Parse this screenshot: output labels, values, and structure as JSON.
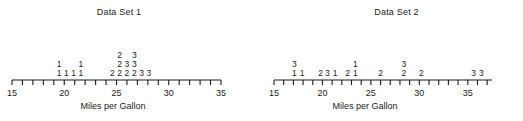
{
  "chart_data": [
    {
      "type": "scatter",
      "plot_style": "stacked-dot-plot",
      "title": "Data Set 1",
      "xlabel": "Miles per Gallon",
      "ylabel": "",
      "xlim": [
        15,
        35
      ],
      "tick_step": 1,
      "tick_labels": [
        "15",
        "20",
        "25",
        "30",
        "35"
      ],
      "tick_label_values": [
        15,
        20,
        25,
        30,
        35
      ],
      "grid": false,
      "legend": "none",
      "point_glyph": "digit",
      "stacks": [
        {
          "x": 19.5,
          "glyphs": [
            "1",
            "1"
          ]
        },
        {
          "x": 20.2,
          "glyphs": [
            "1"
          ]
        },
        {
          "x": 20.9,
          "glyphs": [
            "1"
          ]
        },
        {
          "x": 21.6,
          "glyphs": [
            "1",
            "1"
          ]
        },
        {
          "x": 24.6,
          "glyphs": [
            "2"
          ]
        },
        {
          "x": 25.3,
          "glyphs": [
            "2",
            "2",
            "2"
          ]
        },
        {
          "x": 26.0,
          "glyphs": [
            "2",
            "3"
          ]
        },
        {
          "x": 26.7,
          "glyphs": [
            "2",
            "3",
            "3"
          ]
        },
        {
          "x": 27.4,
          "glyphs": [
            "3"
          ]
        },
        {
          "x": 28.1,
          "glyphs": [
            "3"
          ]
        }
      ]
    },
    {
      "type": "scatter",
      "plot_style": "stacked-dot-plot",
      "title": "Data Set 2",
      "xlabel": "Miles per Gallon",
      "ylabel": "",
      "xlim": [
        15,
        37.5
      ],
      "tick_step": 1,
      "tick_labels": [
        "15",
        "20",
        "25",
        "30",
        "35"
      ],
      "tick_label_values": [
        15,
        20,
        25,
        30,
        35
      ],
      "grid": false,
      "legend": "none",
      "point_glyph": "digit",
      "stacks": [
        {
          "x": 17.1,
          "glyphs": [
            "1",
            "3"
          ]
        },
        {
          "x": 17.9,
          "glyphs": [
            "1"
          ]
        },
        {
          "x": 19.8,
          "glyphs": [
            "2"
          ]
        },
        {
          "x": 20.5,
          "glyphs": [
            "3"
          ]
        },
        {
          "x": 21.3,
          "glyphs": [
            "1"
          ]
        },
        {
          "x": 22.6,
          "glyphs": [
            "2"
          ]
        },
        {
          "x": 23.4,
          "glyphs": [
            "1",
            "1"
          ]
        },
        {
          "x": 26.0,
          "glyphs": [
            "2"
          ]
        },
        {
          "x": 28.4,
          "glyphs": [
            "2",
            "3"
          ]
        },
        {
          "x": 30.2,
          "glyphs": [
            "2"
          ]
        },
        {
          "x": 35.6,
          "glyphs": [
            "3"
          ]
        },
        {
          "x": 36.4,
          "glyphs": [
            "3"
          ]
        }
      ]
    }
  ],
  "charts": [
    {
      "id": "chart-1",
      "title": "Data Set 1",
      "axis_title": "Miles per Gallon",
      "axis_px": {
        "x0": 12,
        "x1": 221,
        "y": 80,
        "tick_len": 5
      },
      "x_min": 15,
      "x_max": 35,
      "tick_step": 1,
      "labels": [
        {
          "value": 15,
          "text": "15"
        },
        {
          "value": 20,
          "text": "20"
        },
        {
          "value": 25,
          "text": "25"
        },
        {
          "value": 30,
          "text": "30"
        },
        {
          "value": 35,
          "text": "35"
        }
      ],
      "stacks": [
        {
          "x": 19.5,
          "glyphs": [
            "1",
            "1"
          ]
        },
        {
          "x": 20.2,
          "glyphs": [
            "1"
          ]
        },
        {
          "x": 20.9,
          "glyphs": [
            "1"
          ]
        },
        {
          "x": 21.6,
          "glyphs": [
            "1",
            "1"
          ]
        },
        {
          "x": 24.6,
          "glyphs": [
            "2"
          ]
        },
        {
          "x": 25.3,
          "glyphs": [
            "2",
            "2",
            "2"
          ]
        },
        {
          "x": 26.0,
          "glyphs": [
            "2",
            "3"
          ]
        },
        {
          "x": 26.7,
          "glyphs": [
            "2",
            "3",
            "3"
          ]
        },
        {
          "x": 27.4,
          "glyphs": [
            "3"
          ]
        },
        {
          "x": 28.1,
          "glyphs": [
            "3"
          ]
        }
      ]
    },
    {
      "id": "chart-2",
      "title": "Data Set 2",
      "axis_title": "Miles per Gallon",
      "axis_px": {
        "x0": 12,
        "x1": 230,
        "y": 80,
        "tick_len": 5
      },
      "x_min": 15,
      "x_max": 37.5,
      "tick_step": 1,
      "labels": [
        {
          "value": 15,
          "text": "15"
        },
        {
          "value": 20,
          "text": "20"
        },
        {
          "value": 25,
          "text": "25"
        },
        {
          "value": 30,
          "text": "30"
        },
        {
          "value": 35,
          "text": "35"
        }
      ],
      "stacks": [
        {
          "x": 17.1,
          "glyphs": [
            "1",
            "3"
          ]
        },
        {
          "x": 17.9,
          "glyphs": [
            "1"
          ]
        },
        {
          "x": 19.8,
          "glyphs": [
            "2"
          ]
        },
        {
          "x": 20.5,
          "glyphs": [
            "3"
          ]
        },
        {
          "x": 21.3,
          "glyphs": [
            "1"
          ]
        },
        {
          "x": 22.6,
          "glyphs": [
            "2"
          ]
        },
        {
          "x": 23.4,
          "glyphs": [
            "1",
            "1"
          ]
        },
        {
          "x": 26.0,
          "glyphs": [
            "2"
          ]
        },
        {
          "x": 28.4,
          "glyphs": [
            "2",
            "3"
          ]
        },
        {
          "x": 30.2,
          "glyphs": [
            "2"
          ]
        },
        {
          "x": 35.6,
          "glyphs": [
            "3"
          ]
        },
        {
          "x": 36.4,
          "glyphs": [
            "3"
          ]
        }
      ]
    }
  ],
  "style": {
    "axis_color": "#1a1a1a",
    "text_color": "#1a1a1a",
    "background": "#ffffff"
  }
}
